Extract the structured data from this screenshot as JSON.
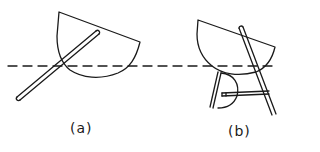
{
  "diagram": {
    "colors": {
      "stroke": "#1a1a1a",
      "background": "#ffffff"
    },
    "waterline": {
      "style": "dashed",
      "y": 66
    },
    "panels": [
      {
        "id": "a",
        "label": "(a)",
        "elements": [
          "hull-section",
          "diagonal-rod"
        ]
      },
      {
        "id": "b",
        "label": "(b)",
        "elements": [
          "hull-section",
          "diagonal-rod",
          "leeboard",
          "cross-brace"
        ]
      }
    ]
  }
}
